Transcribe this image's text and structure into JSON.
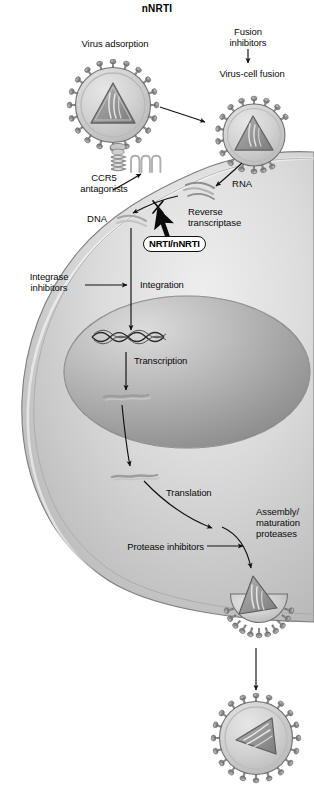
{
  "figure": {
    "title": "nNRTI"
  },
  "labels": {
    "virus_adsorption": "Virus adsorption",
    "fusion_inhibitors_l1": "Fusion",
    "fusion_inhibitors_l2": "inhibitors",
    "virus_cell_fusion": "Virus-cell fusion",
    "ccr5_l1": "CCR5",
    "ccr5_l2": "antagonists",
    "rna": "RNA",
    "dna": "DNA",
    "reverse_transcriptase_l1": "Reverse",
    "reverse_transcriptase_l2": "transcriptase",
    "nrti_nnrti": "NRTI/nNRTI",
    "integrase_l1": "Integrase",
    "integrase_l2": "inhibitors",
    "integration": "Integration",
    "transcription": "Transcription",
    "translation": "Translation",
    "assembly_l1": "Assembly/",
    "assembly_l2": "maturation",
    "assembly_l3": "proteases",
    "protease_inhibitors": "Protease inhibitors"
  },
  "icons": {
    "virion_adsorbing": "hiv-virion-icon",
    "virion_fusing": "hiv-virion-fusing-icon",
    "virion_budding": "hiv-virion-budding-icon",
    "virion_released": "hiv-virion-released-icon",
    "ccr5_receptor": "ccr5-receptor-icon",
    "cd4_receptor": "cd4-receptor-icon",
    "viral_rna": "viral-rna-strand-icon",
    "viral_dna": "viral-dna-strand-icon",
    "provirus_dna": "integrated-provirus-dna-icon",
    "nuclear_mrna": "nuclear-mrna-icon",
    "cytoplasmic_mrna": "cytoplasmic-mrna-icon",
    "block_marker": "block-x-icon",
    "inhibition_arrow": "thick-inhibition-arrow-icon"
  },
  "colors": {
    "background": "#ffffff",
    "cell_cytoplasm_light": "#e3e3e3",
    "cell_cytoplasm_mid": "#cbcbcb",
    "cell_cytoplasm_dark": "#b4b4b4",
    "nucleus_light": "#d6d6d6",
    "nucleus_mid": "#b6b6b6",
    "nucleus_dark": "#8f8f8f",
    "virion_envelope": "#d2d2d2",
    "virion_spike": "#8d8d8d",
    "capsid": "#9a9a9a",
    "outline": "#4a4a4a",
    "text": "#0b0b0b",
    "arrow": "#101010"
  }
}
